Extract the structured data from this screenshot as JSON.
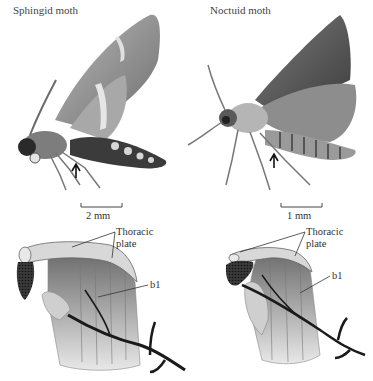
{
  "panels": {
    "sphingid": {
      "title": "Sphingid moth",
      "scale_label": "2 mm",
      "labels": {
        "thoracic_plate_line1": "Thoracic",
        "thoracic_plate_line2": "plate",
        "b1": "b1"
      }
    },
    "noctuid": {
      "title": "Noctuid moth",
      "scale_label": "1 mm",
      "labels": {
        "thoracic_plate_line1": "Thoracic",
        "thoracic_plate_line2": "plate",
        "b1": "b1"
      }
    }
  },
  "colors": {
    "wing_light": "#c9c9c9",
    "wing_mid": "#9a9a9a",
    "wing_dark": "#555555",
    "body_dark": "#2a2a2a",
    "nerve": "#222222"
  }
}
